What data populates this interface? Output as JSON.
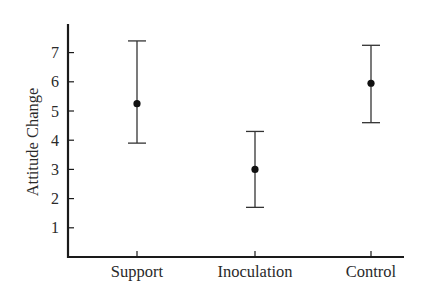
{
  "chart_data": {
    "type": "scatter",
    "subtype": "point-with-error-bars",
    "title": "",
    "xlabel": "",
    "ylabel": "Attitude Change",
    "categories": [
      "Support",
      "Inoculation",
      "Control"
    ],
    "series": [
      {
        "name": "Attitude Change",
        "values": [
          5.25,
          3.0,
          5.95
        ],
        "error_upper": [
          7.4,
          4.3,
          7.25
        ],
        "error_lower": [
          3.9,
          1.7,
          4.6
        ]
      }
    ],
    "yticks": [
      1,
      2,
      3,
      4,
      5,
      6,
      7
    ],
    "ylim": [
      0,
      7.9
    ],
    "grid": false,
    "legend": null
  },
  "colors": {
    "axis": "#1a1a1a",
    "marker": "#111111",
    "errorbar": "#333333",
    "text": "#2a2a2a"
  }
}
